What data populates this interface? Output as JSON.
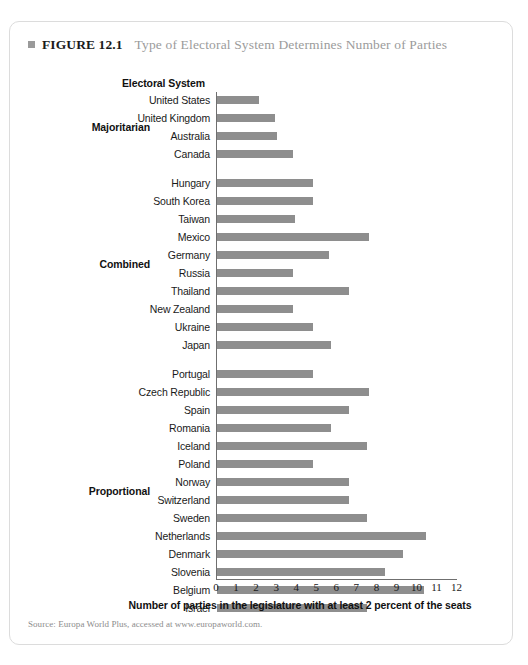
{
  "figure": {
    "bullet_icon": "square-bullet-icon",
    "label": "FIGURE 12.1",
    "title": "Type of Electoral System Determines Number of Parties",
    "source": "Source: Europa World Plus, accessed at www.europaworld.com."
  },
  "axis_heading": "Electoral System",
  "colors": {
    "bar": "#8e8e8e",
    "axis": "#6f6f6f",
    "title_gray": "#9b9b9b",
    "card_border": "#dcdcdc"
  },
  "chart_data": {
    "type": "bar",
    "orientation": "horizontal",
    "title": "Type of Electoral System Determines Number of Parties",
    "xlabel": "Number of parties in the legislature with at least 2 percent of the seats",
    "ylabel": "Electoral System",
    "xlim": [
      0,
      12
    ],
    "xticks": [
      0,
      1,
      2,
      3,
      4,
      5,
      6,
      7,
      8,
      9,
      10,
      11,
      12
    ],
    "grid": false,
    "legend": null,
    "groups": [
      {
        "name": "Majoritarian",
        "categories": [
          "United States",
          "United Kingdom",
          "Australia",
          "Canada"
        ],
        "values": [
          2.1,
          2.9,
          3.0,
          3.8
        ]
      },
      {
        "name": "Combined",
        "categories": [
          "Hungary",
          "South Korea",
          "Taiwan",
          "Mexico",
          "Germany",
          "Russia",
          "Thailand",
          "New Zealand",
          "Ukraine",
          "Japan"
        ],
        "values": [
          4.8,
          4.8,
          3.9,
          7.6,
          5.6,
          3.8,
          6.6,
          3.8,
          4.8,
          5.7
        ]
      },
      {
        "name": "Proportional",
        "categories": [
          "Portugal",
          "Czech Republic",
          "Spain",
          "Romania",
          "Iceland",
          "Poland",
          "Norway",
          "Switzerland",
          "Sweden",
          "Netherlands",
          "Denmark",
          "Slovenia",
          "Belgium",
          "Israel"
        ],
        "values": [
          4.8,
          7.6,
          6.6,
          5.7,
          7.5,
          4.8,
          6.6,
          6.6,
          7.5,
          10.4,
          9.3,
          8.4,
          10.3,
          7.5
        ]
      }
    ]
  }
}
